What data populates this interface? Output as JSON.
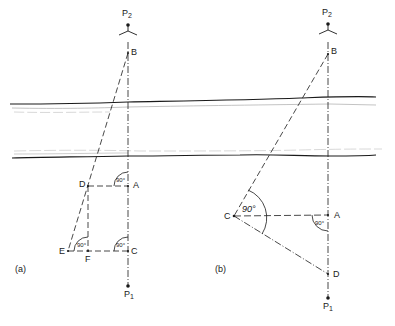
{
  "figure": {
    "colors": {
      "ink": "#1a1a1a",
      "faint": "#9a9a9a",
      "background": "#ffffff"
    },
    "river": {
      "description": "river with two banks crossing both panels horizontally"
    },
    "panel_a": {
      "caption": "(a)",
      "points": {
        "P2": {
          "label": "P",
          "sub": "2"
        },
        "B": {
          "label": "B"
        },
        "A": {
          "label": "A"
        },
        "C": {
          "label": "C"
        },
        "D": {
          "label": "D"
        },
        "E": {
          "label": "E"
        },
        "F": {
          "label": "F"
        },
        "P1": {
          "label": "P",
          "sub": "1"
        }
      },
      "angles": {
        "at_A": "90°",
        "at_C": "90°",
        "at_F": "90°"
      }
    },
    "panel_b": {
      "caption": "(b)",
      "points": {
        "P2": {
          "label": "P",
          "sub": "2"
        },
        "B": {
          "label": "B"
        },
        "A": {
          "label": "A"
        },
        "C": {
          "label": "C"
        },
        "D": {
          "label": "D"
        },
        "P1": {
          "label": "P",
          "sub": "1"
        }
      },
      "angles": {
        "at_A": "90°",
        "at_C": "90°"
      }
    }
  }
}
